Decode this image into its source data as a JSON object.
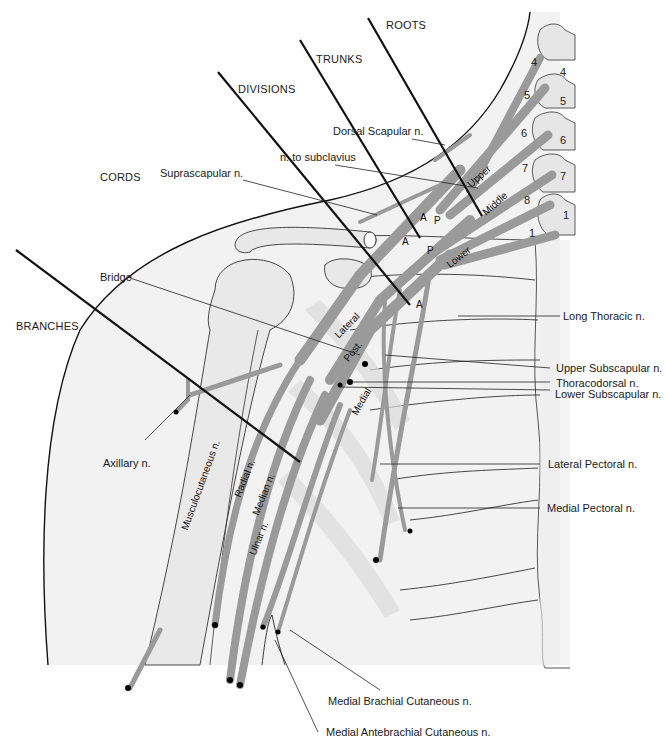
{
  "diagram": {
    "section_labels": {
      "roots": "ROOTS",
      "trunks": "TRUNKS",
      "divisions": "DIVISIONS",
      "cords": "CORDS",
      "branches": "BRANCHES"
    },
    "left_labels": {
      "suprascapular": "Suprascapular n.",
      "subclavius": "n. to subclavius",
      "dorsal_scapular": "Dorsal Scapular n.",
      "bridge": "Bridge",
      "axillary": "Axillary n."
    },
    "right_labels": {
      "long_thoracic": "Long Thoracic n.",
      "upper_subscapular": "Upper Subscapular n.",
      "thoracodorsal": "Thoracodorsal n.",
      "lower_subscapular": "Lower Subscapular n.",
      "lateral_pectoral": "Lateral Pectoral n.",
      "medial_pectoral": "Medial Pectoral n."
    },
    "bottom_labels": {
      "medial_brachial_cutaneous": "Medial Brachial Cutaneous n.",
      "medial_antebrachial_cutaneous": "Medial Antebrachial Cutaneous n."
    },
    "trunk_labels": {
      "upper": "Upper",
      "middle": "Middle",
      "lower": "Lower"
    },
    "cord_labels": {
      "lateral": "Lateral",
      "posterior": "Post.",
      "medial": "Medial"
    },
    "branch_labels": {
      "musculocutaneous": "Musculocutaneous n.",
      "radial": "Radial n.",
      "median": "Median n.",
      "ulnar": "Ulnar n."
    },
    "division_labels": {
      "anterior": "A",
      "posterior": "P"
    },
    "root_numbers_on_nerves": [
      "4",
      "5",
      "6",
      "7",
      "8",
      "1"
    ],
    "vertebra_numbers": [
      "4",
      "5",
      "6",
      "7",
      "1"
    ],
    "colors": {
      "nerve_fill": "#9a9a9a",
      "nerve_stroke": "#555555",
      "bone_fill": "#ececec",
      "skin_fill": "#f2f2f2",
      "line": "#111111"
    }
  }
}
